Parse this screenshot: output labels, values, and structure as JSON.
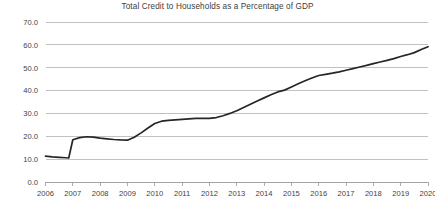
{
  "chart_data": {
    "type": "line",
    "title": "Total Credit to Households as a Percentage of GDP",
    "xlabel": "",
    "ylabel": "",
    "xlim": [
      2006,
      2020
    ],
    "ylim": [
      0,
      70
    ],
    "grid": true,
    "legend": false,
    "legend_position": "none",
    "line_color": "#262626",
    "gridline_color": "#b2b2b2",
    "y_ticks": [
      "0.0",
      "10.0",
      "20.0",
      "30.0",
      "40.0",
      "50.0",
      "60.0",
      "70.0"
    ],
    "y_tick_values": [
      0,
      10,
      20,
      30,
      40,
      50,
      60,
      70
    ],
    "x_ticks": [
      "2006",
      "2007",
      "2008",
      "2009",
      "2010",
      "2011",
      "2012",
      "2013",
      "2014",
      "2015",
      "2016",
      "2017",
      "2018",
      "2019",
      "2020"
    ],
    "x_tick_values": [
      2006,
      2007,
      2008,
      2009,
      2010,
      2011,
      2012,
      2013,
      2014,
      2015,
      2016,
      2017,
      2018,
      2019,
      2020
    ],
    "series": [
      {
        "name": "Total credit to households (% of GDP)",
        "x": [
          2006.0,
          2006.25,
          2006.5,
          2006.75,
          2006.85,
          2007.0,
          2007.25,
          2007.5,
          2007.75,
          2008.0,
          2008.25,
          2008.5,
          2008.75,
          2009.0,
          2009.25,
          2009.5,
          2009.75,
          2010.0,
          2010.25,
          2010.5,
          2010.75,
          2011.0,
          2011.25,
          2011.5,
          2011.75,
          2012.0,
          2012.25,
          2012.5,
          2012.75,
          2013.0,
          2013.25,
          2013.5,
          2013.75,
          2014.0,
          2014.25,
          2014.5,
          2014.75,
          2015.0,
          2015.25,
          2015.5,
          2015.75,
          2016.0,
          2016.25,
          2016.5,
          2016.75,
          2017.0,
          2017.25,
          2017.5,
          2017.75,
          2018.0,
          2018.25,
          2018.5,
          2018.75,
          2019.0,
          2019.25,
          2019.5,
          2019.75,
          2020.0
        ],
        "values": [
          11.3,
          11.0,
          10.8,
          10.6,
          10.5,
          18.5,
          19.4,
          19.8,
          19.6,
          19.2,
          18.9,
          18.6,
          18.4,
          18.3,
          19.6,
          21.5,
          23.6,
          25.6,
          26.6,
          27.0,
          27.2,
          27.4,
          27.6,
          27.8,
          27.9,
          27.8,
          28.2,
          29.0,
          30.0,
          31.2,
          32.6,
          34.0,
          35.4,
          36.8,
          38.2,
          39.4,
          40.2,
          41.6,
          43.0,
          44.3,
          45.5,
          46.6,
          47.1,
          47.6,
          48.2,
          48.9,
          49.6,
          50.3,
          51.0,
          51.8,
          52.5,
          53.2,
          54.0,
          54.9,
          55.7,
          56.6,
          58.0,
          59.2
        ]
      }
    ],
    "notable_points": {
      "start_2006": 11.3,
      "trough_2006": 10.5,
      "jump_2007": 18.5,
      "local_peak_2007": 19.8,
      "plateau_2008_2009": 18.3,
      "plateau_2011_2012": 27.8,
      "value_2013": 31.2,
      "value_2014": 36.8,
      "value_2016": 46.6,
      "value_2018": 51.8,
      "end_2020": 59.2
    }
  }
}
